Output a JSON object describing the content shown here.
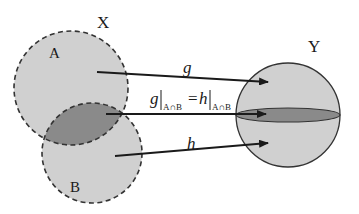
{
  "diagram": {
    "labels": {
      "domain": "X",
      "codomain": "Y",
      "set_a": "A",
      "set_b": "B"
    },
    "maps": {
      "g": "g",
      "h": "h",
      "restriction": {
        "g": "g",
        "eq": "=",
        "h": "h",
        "sub": "A∩B"
      }
    },
    "colors": {
      "light_fill": "#d0d0d0",
      "intersection_fill": "#8a8a8a",
      "stroke": "#333333",
      "arrow": "#1a1a1a"
    }
  }
}
